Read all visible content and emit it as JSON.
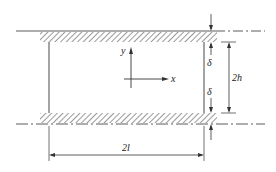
{
  "diagram": {
    "type": "channel-geometry",
    "labels": {
      "y_axis": "y",
      "x_axis": "x",
      "delta_top": "δ",
      "delta_bottom": "δ",
      "height": "2h",
      "length": "2l"
    },
    "colors": {
      "line": "#333333",
      "hatch": "#555555",
      "background": "#ffffff"
    }
  }
}
